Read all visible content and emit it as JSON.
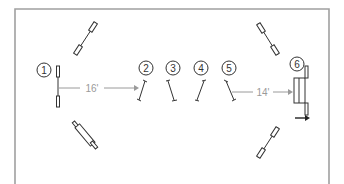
{
  "diagram": {
    "colors": {
      "border": "#9a9a9a",
      "stroke": "#333333",
      "measure": "#9a9a9a",
      "background": "#ffffff"
    },
    "elements": [
      {
        "id": 1,
        "label": "1",
        "type": "vertical"
      },
      {
        "id": 2,
        "label": "2",
        "type": "pole"
      },
      {
        "id": 3,
        "label": "3",
        "type": "pole"
      },
      {
        "id": 4,
        "label": "4",
        "type": "pole"
      },
      {
        "id": 5,
        "label": "5",
        "type": "pole"
      },
      {
        "id": 6,
        "label": "6",
        "type": "oxer"
      }
    ],
    "distances": [
      {
        "from": "1",
        "to": "2",
        "label": "16'"
      },
      {
        "from": "5",
        "to": "6",
        "label": "14'"
      }
    ],
    "direction_arrow": "right"
  }
}
